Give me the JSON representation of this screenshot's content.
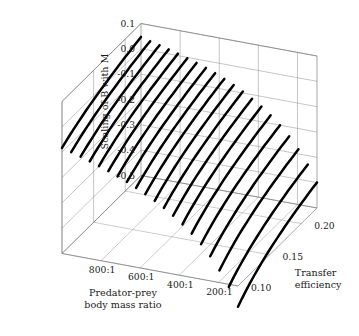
{
  "figure": {
    "title": "",
    "background_color": "#ffffff",
    "curve_color": "#000000",
    "grid_color": "#8c8c8c",
    "box_color": "#6b6b6b"
  },
  "axes": {
    "z_vertical": {
      "name": "Scaling of B with M",
      "label": "Scaling of B with M",
      "ticks": [
        "0.1",
        "0.0",
        "-0.1",
        "-0.2",
        "-0.3",
        "-0.4",
        "-0.5"
      ],
      "tick_values": [
        0.1,
        0.0,
        -0.1,
        -0.2,
        -0.3,
        -0.4,
        -0.5
      ],
      "range": [
        -0.5,
        0.1
      ]
    },
    "x_depth_left": {
      "name": "Predator-prey body mass ratio",
      "label_line1": "Predator-prey",
      "label_line2": "body mass ratio",
      "ticks": [
        "800:1",
        "600:1",
        "400:1",
        "200:1"
      ],
      "tick_values": [
        800,
        600,
        400,
        200
      ],
      "range": [
        1000,
        100
      ]
    },
    "y_depth_right": {
      "name": "Transfer efficiency",
      "label_line1": "Transfer",
      "label_line2": "efficiency",
      "ticks": [
        "0.10",
        "0.15",
        "0.20"
      ],
      "tick_values": [
        0.1,
        0.15,
        0.2
      ],
      "range": [
        0.1,
        0.225
      ]
    }
  },
  "chart_data": {
    "type": "line",
    "title": "",
    "xlabel": "Predator-prey body mass ratio",
    "ylabel": "Transfer efficiency",
    "zlabel": "Scaling of B with M",
    "grid": true,
    "legend": "none",
    "projection": "3d-surface-wireframe",
    "xlim": [
      100,
      1000
    ],
    "ylim": [
      0.1,
      0.225
    ],
    "zlim": [
      -0.5,
      0.1
    ],
    "x_ticks": [
      800,
      600,
      400,
      200
    ],
    "x_tick_labels": [
      "800:1",
      "600:1",
      "400:1",
      "200:1"
    ],
    "y_ticks": [
      0.1,
      0.15,
      0.2
    ],
    "y_tick_labels": [
      "0.10",
      "0.15",
      "0.20"
    ],
    "z_ticks": [
      0.1,
      0.0,
      -0.1,
      -0.2,
      -0.3,
      -0.4,
      -0.5
    ],
    "z_tick_labels": [
      "0.1",
      "0.0",
      "-0.1",
      "-0.2",
      "-0.3",
      "-0.4",
      "-0.5"
    ],
    "n_curves": 20,
    "curve_axis": "transfer_efficiency",
    "curve_parameter_axis": "predator_prey_body_mass_ratio",
    "curve_parameter_values": [
      1000,
      953,
      905,
      858,
      811,
      763,
      716,
      668,
      621,
      574,
      526,
      479,
      432,
      384,
      337,
      289,
      242,
      195,
      147,
      100
    ],
    "samples_per_curve": 21,
    "transfer_efficiency_samples": [
      0.1,
      0.10625,
      0.1125,
      0.11875,
      0.125,
      0.13125,
      0.1375,
      0.14375,
      0.15,
      0.15625,
      0.1625,
      0.16875,
      0.175,
      0.18125,
      0.1875,
      0.19375,
      0.2,
      0.20625,
      0.2125,
      0.21875,
      0.225
    ],
    "series": [
      {
        "name": "ratio 1000:1",
        "values": [
          -0.083,
          -0.073,
          -0.063,
          -0.054,
          -0.046,
          -0.038,
          -0.03,
          -0.023,
          -0.016,
          -0.01,
          -0.004,
          0.002,
          0.008,
          0.013,
          0.019,
          0.024,
          0.029,
          0.033,
          0.038,
          0.042,
          0.047
        ]
      },
      {
        "name": "ratio 953:1",
        "values": [
          -0.093,
          -0.083,
          -0.073,
          -0.064,
          -0.055,
          -0.047,
          -0.039,
          -0.032,
          -0.025,
          -0.019,
          -0.013,
          -0.007,
          -0.001,
          0.004,
          0.009,
          0.015,
          0.019,
          0.024,
          0.029,
          0.033,
          0.037
        ]
      },
      {
        "name": "ratio 905:1",
        "values": [
          -0.104,
          -0.094,
          -0.084,
          -0.075,
          -0.066,
          -0.057,
          -0.049,
          -0.042,
          -0.035,
          -0.029,
          -0.022,
          -0.016,
          -0.011,
          -0.005,
          0.0,
          0.005,
          0.01,
          0.015,
          0.019,
          0.024,
          0.028
        ]
      },
      {
        "name": "ratio 858:1",
        "values": [
          -0.116,
          -0.105,
          -0.095,
          -0.086,
          -0.077,
          -0.068,
          -0.06,
          -0.053,
          -0.046,
          -0.039,
          -0.033,
          -0.027,
          -0.021,
          -0.015,
          -0.01,
          -0.005,
          0.0,
          0.005,
          0.01,
          0.014,
          0.018
        ]
      },
      {
        "name": "ratio 811:1",
        "values": [
          -0.128,
          -0.117,
          -0.107,
          -0.098,
          -0.088,
          -0.08,
          -0.072,
          -0.064,
          -0.057,
          -0.05,
          -0.044,
          -0.038,
          -0.032,
          -0.026,
          -0.021,
          -0.016,
          -0.011,
          -0.006,
          -0.001,
          0.003,
          0.008
        ]
      },
      {
        "name": "ratio 763:1",
        "values": [
          -0.141,
          -0.13,
          -0.12,
          -0.11,
          -0.101,
          -0.092,
          -0.084,
          -0.076,
          -0.069,
          -0.062,
          -0.056,
          -0.049,
          -0.043,
          -0.038,
          -0.032,
          -0.027,
          -0.022,
          -0.017,
          -0.012,
          -0.008,
          -0.003
        ]
      },
      {
        "name": "ratio 716:1",
        "values": [
          -0.155,
          -0.144,
          -0.133,
          -0.123,
          -0.114,
          -0.105,
          -0.097,
          -0.089,
          -0.082,
          -0.075,
          -0.068,
          -0.062,
          -0.056,
          -0.05,
          -0.045,
          -0.039,
          -0.034,
          -0.029,
          -0.024,
          -0.02,
          -0.015
        ]
      },
      {
        "name": "ratio 668:1",
        "values": [
          -0.17,
          -0.159,
          -0.148,
          -0.138,
          -0.128,
          -0.119,
          -0.111,
          -0.103,
          -0.095,
          -0.088,
          -0.082,
          -0.075,
          -0.069,
          -0.063,
          -0.058,
          -0.052,
          -0.047,
          -0.042,
          -0.037,
          -0.033,
          -0.028
        ]
      },
      {
        "name": "ratio 621:1",
        "values": [
          -0.187,
          -0.175,
          -0.164,
          -0.154,
          -0.144,
          -0.135,
          -0.126,
          -0.118,
          -0.11,
          -0.103,
          -0.096,
          -0.09,
          -0.084,
          -0.078,
          -0.072,
          -0.067,
          -0.061,
          -0.056,
          -0.051,
          -0.047,
          -0.042
        ]
      },
      {
        "name": "ratio 574:1",
        "values": [
          -0.205,
          -0.193,
          -0.181,
          -0.171,
          -0.161,
          -0.152,
          -0.143,
          -0.135,
          -0.127,
          -0.12,
          -0.113,
          -0.106,
          -0.1,
          -0.094,
          -0.088,
          -0.083,
          -0.077,
          -0.072,
          -0.067,
          -0.062,
          -0.058
        ]
      },
      {
        "name": "ratio 526:1",
        "values": [
          -0.225,
          -0.212,
          -0.2,
          -0.19,
          -0.18,
          -0.17,
          -0.161,
          -0.153,
          -0.145,
          -0.138,
          -0.131,
          -0.124,
          -0.118,
          -0.112,
          -0.106,
          -0.1,
          -0.095,
          -0.09,
          -0.085,
          -0.08,
          -0.075
        ]
      },
      {
        "name": "ratio 479:1",
        "values": [
          -0.246,
          -0.233,
          -0.221,
          -0.211,
          -0.2,
          -0.191,
          -0.182,
          -0.173,
          -0.165,
          -0.158,
          -0.151,
          -0.144,
          -0.138,
          -0.131,
          -0.125,
          -0.12,
          -0.114,
          -0.109,
          -0.104,
          -0.099,
          -0.094
        ]
      },
      {
        "name": "ratio 432:1",
        "values": [
          -0.27,
          -0.257,
          -0.245,
          -0.234,
          -0.223,
          -0.213,
          -0.204,
          -0.196,
          -0.188,
          -0.18,
          -0.173,
          -0.166,
          -0.16,
          -0.153,
          -0.147,
          -0.142,
          -0.136,
          -0.131,
          -0.126,
          -0.121,
          -0.116
        ]
      },
      {
        "name": "ratio 384:1",
        "values": [
          -0.297,
          -0.283,
          -0.271,
          -0.26,
          -0.249,
          -0.239,
          -0.23,
          -0.221,
          -0.213,
          -0.205,
          -0.198,
          -0.191,
          -0.184,
          -0.178,
          -0.172,
          -0.166,
          -0.16,
          -0.155,
          -0.15,
          -0.145,
          -0.14
        ]
      },
      {
        "name": "ratio 337:1",
        "values": [
          -0.327,
          -0.313,
          -0.301,
          -0.289,
          -0.278,
          -0.268,
          -0.259,
          -0.25,
          -0.241,
          -0.233,
          -0.226,
          -0.219,
          -0.212,
          -0.206,
          -0.2,
          -0.194,
          -0.188,
          -0.183,
          -0.178,
          -0.173,
          -0.168
        ]
      },
      {
        "name": "ratio 289:1",
        "values": [
          -0.362,
          -0.348,
          -0.335,
          -0.323,
          -0.312,
          -0.302,
          -0.292,
          -0.283,
          -0.274,
          -0.266,
          -0.259,
          -0.251,
          -0.245,
          -0.238,
          -0.232,
          -0.226,
          -0.22,
          -0.215,
          -0.21,
          -0.205,
          -0.2
        ]
      },
      {
        "name": "ratio 242:1",
        "values": [
          -0.403,
          -0.388,
          -0.375,
          -0.363,
          -0.351,
          -0.341,
          -0.331,
          -0.321,
          -0.313,
          -0.304,
          -0.297,
          -0.289,
          -0.282,
          -0.276,
          -0.27,
          -0.264,
          -0.258,
          -0.252,
          -0.247,
          -0.242,
          -0.237
        ]
      },
      {
        "name": "ratio 195:1",
        "values": [
          -0.452,
          -0.437,
          -0.423,
          -0.41,
          -0.398,
          -0.387,
          -0.377,
          -0.368,
          -0.359,
          -0.35,
          -0.342,
          -0.335,
          -0.328,
          -0.321,
          -0.315,
          -0.309,
          -0.303,
          -0.297,
          -0.292,
          -0.287,
          -0.282
        ]
      },
      {
        "name": "ratio 147:1",
        "values": [
          -0.51,
          -0.494,
          -0.48,
          -0.467,
          -0.455,
          -0.443,
          -0.433,
          -0.423,
          -0.414,
          -0.405,
          -0.397,
          -0.389,
          -0.382,
          -0.375,
          -0.369,
          -0.362,
          -0.356,
          -0.351,
          -0.345,
          -0.34,
          -0.335
        ]
      },
      {
        "name": "ratio 100:1",
        "values": [
          -0.582,
          -0.565,
          -0.55,
          -0.536,
          -0.523,
          -0.511,
          -0.5,
          -0.49,
          -0.48,
          -0.471,
          -0.463,
          -0.455,
          -0.447,
          -0.44,
          -0.433,
          -0.427,
          -0.421,
          -0.415,
          -0.409,
          -0.404,
          -0.399
        ]
      }
    ]
  }
}
